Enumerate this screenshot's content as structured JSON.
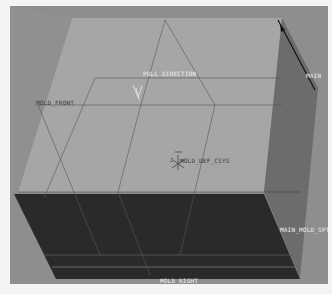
{
  "viewport": {
    "background": "#8e8e8e",
    "colors": {
      "top_face": "#a7a7a7",
      "right_face": "#6e6e6e",
      "front_face": "#2a2a2a",
      "edge_lines": "#505050",
      "highlight_edge": "#111111"
    }
  },
  "labels": {
    "pull_direction": "PULL DIRECTION",
    "mold_front": "MOLD_FRONT",
    "main": "MAIN",
    "csys": "MOLD_DEF_CSYS",
    "csys_axis": "Z",
    "main_mold_spt": "MAIN_MOLD_SPT",
    "mold_right": "MOLD_RIGHT"
  },
  "icons": {
    "pull_direction_arrow": "pull-direction-arrow-icon",
    "csys": "coordinate-system-icon",
    "edge_arrow": "edge-direction-arrow-icon"
  }
}
